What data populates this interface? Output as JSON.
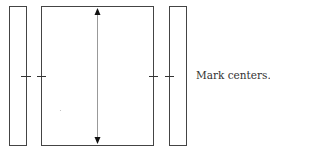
{
  "diagram": {
    "caption": "Mark centers.",
    "stroke_color": "#444444",
    "arrow_color": "#999999",
    "elements": [
      {
        "name": "left-narrow-panel",
        "x": 9,
        "y": 6,
        "w": 17,
        "h": 139
      },
      {
        "name": "center-large-panel",
        "x": 41,
        "y": 6,
        "w": 112,
        "h": 139
      },
      {
        "name": "right-narrow-panel",
        "x": 169,
        "y": 6,
        "w": 17,
        "h": 139
      }
    ],
    "center_marks_y": 76,
    "vertical_arrow": {
      "x": 97,
      "y1": 8,
      "y2": 143
    }
  }
}
